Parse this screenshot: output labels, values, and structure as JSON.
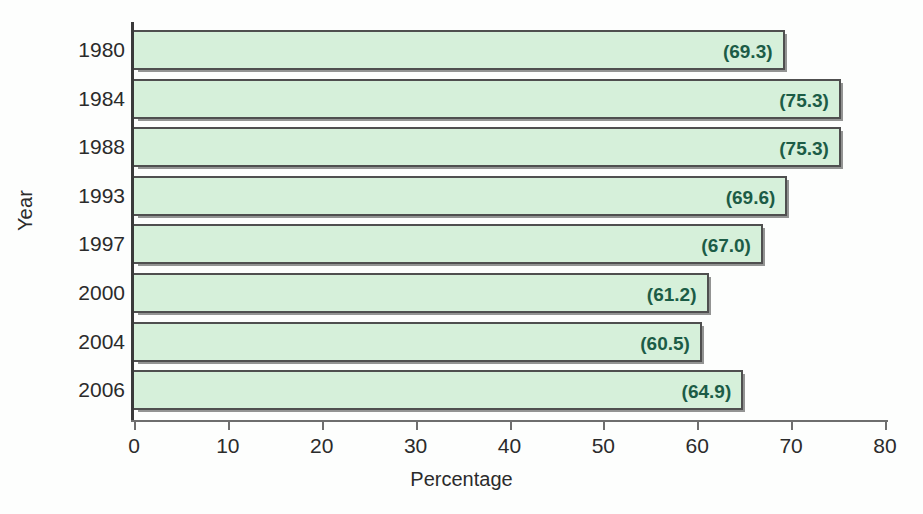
{
  "chart_data": {
    "type": "bar",
    "orientation": "horizontal",
    "title": "",
    "xlabel": "Percentage",
    "ylabel": "Year",
    "categories": [
      "1980",
      "1984",
      "1988",
      "1993",
      "1997",
      "2000",
      "2004",
      "2006"
    ],
    "values": [
      69.3,
      75.3,
      75.3,
      69.6,
      67.0,
      61.2,
      60.5,
      64.9
    ],
    "data_labels": [
      "(69.3)",
      "(75.3)",
      "(75.3)",
      "(69.6)",
      "(67.0)",
      "(61.2)",
      "(60.5)",
      "(64.9)"
    ],
    "xlim": [
      0,
      80
    ],
    "xticks": [
      0,
      10,
      20,
      30,
      40,
      50,
      60,
      70,
      80
    ],
    "xtick_labels": [
      "0",
      "10",
      "20",
      "30",
      "40",
      "50",
      "60",
      "70",
      "80"
    ],
    "grid": false,
    "legend": null,
    "bar_fill_color": "#d6f0da",
    "bar_border_color": "#4f4f4f",
    "data_label_color": "#1c5c46",
    "axis_color": "#3a3a3a",
    "background_color": "#fdfefd"
  }
}
